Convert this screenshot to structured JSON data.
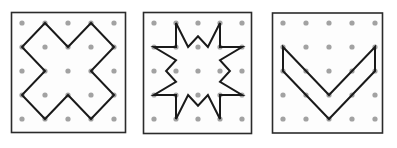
{
  "figure": {
    "title": "",
    "background": "#ffffff",
    "width": 397,
    "height": 148,
    "panel_count": 3
  },
  "style": {
    "frame_stroke": "#2b2b2b",
    "frame_stroke_width": 1.6,
    "frame_fill": "#fdfdfd",
    "dot_color": "#9a9a9a",
    "dot_radius": 2.6,
    "shape_stroke": "#1a1a1a",
    "shape_stroke_width": 2.0,
    "shape_fill": "none"
  },
  "geoboard": {
    "grid_rows": 5,
    "grid_cols": 5,
    "description": "Three geoboard squares each showing a 5 by 5 array of pegs with a rubber-band polygon stretched over the pegs."
  },
  "panels": [
    {
      "id": "panel-1",
      "name": "cross",
      "label": "",
      "frame": {
        "x": 11.5,
        "y": 12.5,
        "width": 114.0,
        "height": 120.0
      },
      "grid": {
        "origin_x": 22.0,
        "origin_y": 23.0,
        "step_x": 23.0,
        "step_y": 24.0,
        "cols": 5,
        "rows": 5
      },
      "shape": {
        "type": "polygon",
        "name": "plus-cross",
        "closed": true,
        "vertex_count": 12,
        "grid_points": [
          [
            1,
            0
          ],
          [
            2,
            1
          ],
          [
            3,
            0
          ],
          [
            4,
            1
          ],
          [
            3,
            2
          ],
          [
            4,
            3
          ],
          [
            3,
            4
          ],
          [
            2,
            3
          ],
          [
            1,
            4
          ],
          [
            0,
            3
          ],
          [
            1,
            2
          ],
          [
            0,
            1
          ]
        ]
      }
    },
    {
      "id": "panel-2",
      "name": "star",
      "label": "",
      "frame": {
        "x": 143.5,
        "y": 12.5,
        "width": 108.0,
        "height": 121.0
      },
      "grid": {
        "origin_x": 154.0,
        "origin_y": 23.0,
        "step_x": 22.0,
        "step_y": 24.0,
        "cols": 5,
        "rows": 5
      },
      "shape": {
        "type": "polygon",
        "name": "eight-pointed-star",
        "closed": true,
        "vertex_count": 24,
        "grid_points": [
          [
            1,
            0
          ],
          [
            1,
            1
          ],
          [
            2,
            1
          ],
          [
            2,
            0
          ],
          [
            3,
            0
          ],
          [
            3,
            1
          ],
          [
            4,
            1
          ],
          [
            4,
            0.9
          ],
          [
            4,
            1
          ],
          [
            3,
            2
          ],
          [
            4,
            3
          ],
          [
            4,
            3
          ],
          [
            3,
            3
          ],
          [
            3,
            4
          ],
          [
            2,
            4
          ],
          [
            2,
            3
          ],
          [
            1,
            3
          ],
          [
            1,
            4
          ],
          [
            0,
            3
          ],
          [
            1,
            2
          ],
          [
            0,
            1
          ]
        ],
        "grid_points_clean": [
          [
            1,
            0
          ],
          [
            1.55,
            1
          ],
          [
            2,
            0.55
          ],
          [
            2.45,
            1
          ],
          [
            3,
            0
          ],
          [
            3,
            1
          ],
          [
            4,
            1
          ],
          [
            3,
            1.55
          ],
          [
            3.45,
            2
          ],
          [
            3,
            2.45
          ],
          [
            4,
            3
          ],
          [
            3,
            3
          ],
          [
            3,
            4
          ],
          [
            2.45,
            3
          ],
          [
            2,
            3.45
          ],
          [
            1.55,
            3
          ],
          [
            1,
            4
          ],
          [
            1,
            3
          ],
          [
            0,
            3
          ],
          [
            1,
            2.45
          ],
          [
            0.55,
            2
          ],
          [
            1,
            1.55
          ],
          [
            0,
            1
          ],
          [
            1,
            1
          ]
        ]
      }
    },
    {
      "id": "panel-3",
      "name": "chevron",
      "label": "",
      "frame": {
        "x": 272.5,
        "y": 13.0,
        "width": 110.0,
        "height": 120.0
      },
      "grid": {
        "origin_x": 283.0,
        "origin_y": 23.0,
        "step_x": 23.0,
        "step_y": 24.0,
        "cols": 5,
        "rows": 5
      },
      "shape": {
        "type": "polygon",
        "name": "v-chevron",
        "closed": true,
        "vertex_count": 6,
        "grid_points": [
          [
            0,
            1
          ],
          [
            2,
            3
          ],
          [
            4,
            1
          ],
          [
            4,
            2
          ],
          [
            2,
            4
          ],
          [
            0,
            2
          ]
        ]
      }
    }
  ]
}
